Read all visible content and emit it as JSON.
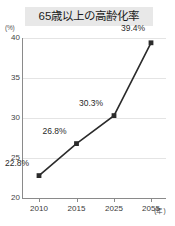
{
  "chart_data": {
    "type": "line",
    "title": "65歳以上の高齢化率",
    "xlabel": "(年)",
    "ylabel": "(%)",
    "categories": [
      "2010",
      "2015",
      "2025",
      "2055"
    ],
    "values": [
      22.8,
      26.8,
      30.3,
      39.4
    ],
    "point_labels": [
      "22.8%",
      "26.8%",
      "30.3%",
      "39.4%"
    ],
    "ylim": [
      20,
      40
    ],
    "yticks": [
      "20",
      "25",
      "30",
      "35",
      "40"
    ],
    "ytick_values": [
      20,
      25,
      30,
      35,
      40
    ],
    "grid": true,
    "legend": false,
    "series_color": "#2b2b2b",
    "grid_color": "#e4e4e4",
    "axis_color": "#8a8a8a",
    "title_background": "#e8e8e8",
    "background": "#ffffff"
  }
}
